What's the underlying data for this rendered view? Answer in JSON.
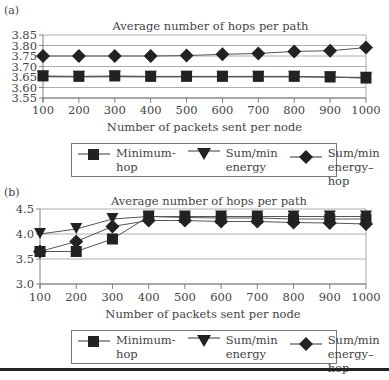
{
  "figure": {
    "divider_color": "#222222"
  },
  "legend": {
    "items": [
      {
        "label": "Minimum-hop",
        "marker": "square"
      },
      {
        "label": "Sum/min\nenergy",
        "marker": "triangle-down"
      },
      {
        "label": "Sum/min\nenergy–hop",
        "marker": "diamond"
      }
    ]
  },
  "chart_data": [
    {
      "panel": "(a)",
      "type": "line",
      "title": "Average number of hops per path",
      "xlabel": "Number of packets sent per node",
      "ylabel": "",
      "categories": [
        100,
        200,
        300,
        400,
        500,
        600,
        700,
        800,
        900,
        1000
      ],
      "yticks": [
        "3.55",
        "3.60",
        "3.65",
        "3.70",
        "3.75",
        "3.80",
        "3.85"
      ],
      "ylim": [
        3.55,
        3.85
      ],
      "grid": true,
      "legend_position": "bottom",
      "series": [
        {
          "name": "Minimum-hop",
          "marker": "square",
          "values": [
            3.655,
            3.653,
            3.655,
            3.653,
            3.653,
            3.653,
            3.653,
            3.653,
            3.65,
            3.645
          ]
        },
        {
          "name": "Sum/min energy",
          "marker": "triangle-down",
          "values": [
            3.652,
            3.651,
            3.652,
            3.651,
            3.651,
            3.651,
            3.651,
            3.651,
            3.649,
            3.646
          ]
        },
        {
          "name": "Sum/min energy–hop",
          "marker": "diamond",
          "values": [
            3.75,
            3.75,
            3.75,
            3.75,
            3.752,
            3.758,
            3.762,
            3.772,
            3.775,
            3.79
          ]
        }
      ]
    },
    {
      "panel": "(b)",
      "type": "line",
      "title": "Average number of hops per path",
      "xlabel": "Number of packets sent per node",
      "ylabel": "",
      "categories": [
        100,
        200,
        300,
        400,
        500,
        600,
        700,
        800,
        900,
        1000
      ],
      "yticks": [
        "3.0",
        "3.5",
        "4.0",
        "4.5"
      ],
      "ylim": [
        3.0,
        4.5
      ],
      "grid": true,
      "legend_position": "bottom",
      "series": [
        {
          "name": "Minimum-hop",
          "marker": "square",
          "values": [
            3.65,
            3.65,
            3.9,
            4.35,
            4.33,
            4.32,
            4.32,
            4.3,
            4.3,
            4.3
          ]
        },
        {
          "name": "Sum/min energy",
          "marker": "triangle-down",
          "values": [
            4.0,
            4.1,
            4.3,
            4.35,
            4.35,
            4.35,
            4.35,
            4.35,
            4.35,
            4.35
          ]
        },
        {
          "name": "Sum/min energy–hop",
          "marker": "diamond",
          "values": [
            3.65,
            3.85,
            4.15,
            4.27,
            4.27,
            4.25,
            4.25,
            4.23,
            4.22,
            4.2
          ]
        }
      ]
    }
  ]
}
